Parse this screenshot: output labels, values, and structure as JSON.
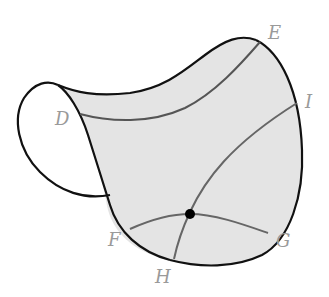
{
  "diagram": {
    "type": "curved surface with geodesic-like curves",
    "colors": {
      "background": "#ffffff",
      "surface_fill": "#e4e4e4",
      "outline": "#111111",
      "curve": "#555555",
      "label": "#9a9a9a",
      "point": "#000000"
    },
    "labels": {
      "D": "D",
      "E": "E",
      "I": "I",
      "F": "F",
      "G": "G",
      "H": "H"
    },
    "curves": [
      {
        "name": "curve-D-E",
        "from": "D",
        "to": "E"
      },
      {
        "name": "curve-H-I",
        "from": "H",
        "to": "I"
      },
      {
        "name": "curve-F-G",
        "from": "F",
        "to": "G"
      }
    ],
    "points": [
      {
        "name": "intersection-point",
        "description": "intersection of curve F-G and curve H-I"
      }
    ]
  }
}
